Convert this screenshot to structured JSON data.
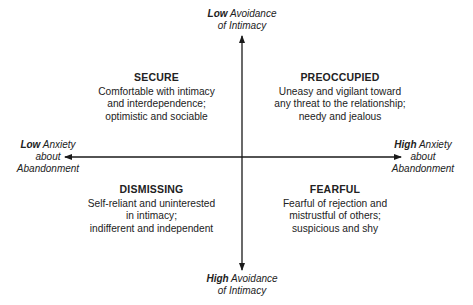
{
  "axes": {
    "top": {
      "bold": "Low",
      "rest_line1": " Avoidance",
      "line2": "of Intimacy"
    },
    "bottom": {
      "bold": "High",
      "rest_line1": " Avoidance",
      "line2": "of Intimacy"
    },
    "left": {
      "bold": "Low",
      "rest_line1": " Anxiety",
      "line2": "about",
      "line3": "Abandonment"
    },
    "right": {
      "bold": "High",
      "rest_line1": " Anxiety",
      "line2": "about",
      "line3": "Abandonment"
    }
  },
  "quadrants": {
    "secure": {
      "title": "SECURE",
      "lines": [
        "Comfortable with intimacy",
        "and interdependence;",
        "optimistic and sociable"
      ]
    },
    "preoccupied": {
      "title": "PREOCCUPIED",
      "lines": [
        "Uneasy and vigilant toward",
        "any threat to the relationship;",
        "needy and jealous"
      ]
    },
    "dismissing": {
      "title": "DISMISSING",
      "lines": [
        "Self-reliant and uninterested",
        "in intimacy;",
        "indifferent and independent"
      ]
    },
    "fearful": {
      "title": "FEARFUL",
      "lines": [
        "Fearful of rejection and",
        "mistrustful of others;",
        "suspicious and shy"
      ]
    }
  }
}
